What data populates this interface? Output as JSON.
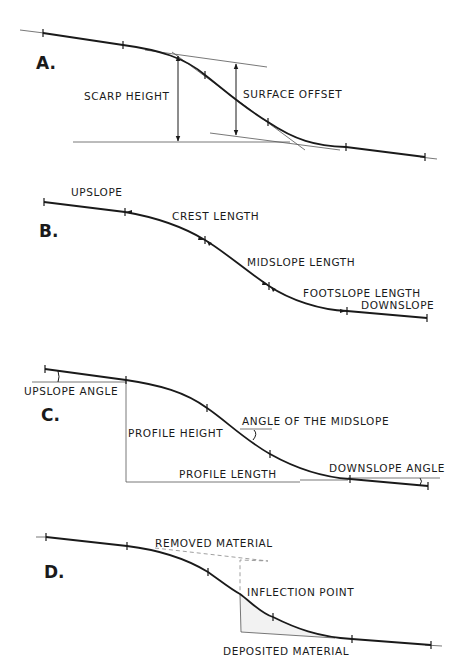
{
  "panels": [
    {
      "id": "A",
      "label": "A.",
      "annotations": {
        "scarp_height": "SCARP HEIGHT",
        "surface_offset": "SURFACE OFFSET"
      }
    },
    {
      "id": "B",
      "label": "B.",
      "annotations": {
        "upslope": "UPSLOPE",
        "crest_length": "CREST LENGTH",
        "midslope_length": "MIDSLOPE LENGTH",
        "footslope_length": "FOOTSLOPE LENGTH",
        "downslope": "DOWNSLOPE"
      }
    },
    {
      "id": "C",
      "label": "C.",
      "annotations": {
        "upslope_angle": "UPSLOPE ANGLE",
        "profile_height": "PROFILE HEIGHT",
        "angle_of_midslope": "ANGLE OF THE MIDSLOPE",
        "profile_length": "PROFILE LENGTH",
        "downslope_angle": "DOWNSLOPE ANGLE"
      }
    },
    {
      "id": "D",
      "label": "D.",
      "annotations": {
        "removed_material": "REMOVED MATERIAL",
        "inflection_point": "INFLECTION POINT",
        "deposited_material": "DEPOSITED MATERIAL"
      }
    }
  ]
}
